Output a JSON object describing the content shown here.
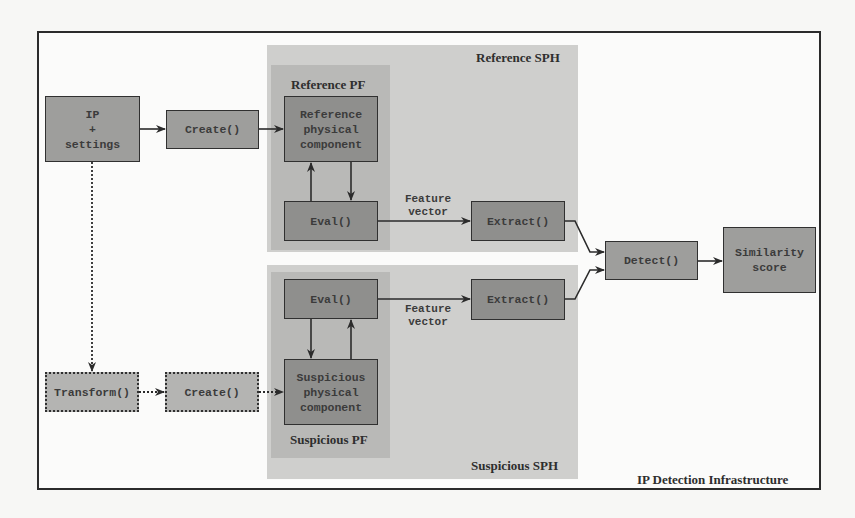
{
  "diagram": {
    "frame_label": "IP Detection Infrastructure",
    "regions": {
      "reference_sph": "Reference SPH",
      "suspicious_sph": "Suspicious SPH",
      "reference_pf": "Reference PF",
      "suspicious_pf": "Suspicious PF"
    },
    "nodes": {
      "ip_settings": "IP\n+\nsettings",
      "create_top": "Create()",
      "ref_physical": "Reference\nphysical\ncomponent",
      "eval_ref": "Eval()",
      "extract_ref": "Extract()",
      "transform": "Transform()",
      "create_bottom": "Create()",
      "susp_physical": "Suspicious\nphysical\ncomponent",
      "eval_susp": "Eval()",
      "extract_susp": "Extract()",
      "detect": "Detect()",
      "similarity": "Similarity\nscore"
    },
    "edge_labels": {
      "feature_vector_top": "Feature\nvector",
      "feature_vector_bottom": "Feature\nvector"
    },
    "edges": [
      {
        "from": "ip_settings",
        "to": "create_top",
        "style": "solid"
      },
      {
        "from": "create_top",
        "to": "ref_physical",
        "style": "solid"
      },
      {
        "from": "ref_physical",
        "to": "eval_ref",
        "style": "solid"
      },
      {
        "from": "eval_ref",
        "to": "ref_physical",
        "style": "solid"
      },
      {
        "from": "eval_ref",
        "to": "extract_ref",
        "style": "solid",
        "label": "Feature vector"
      },
      {
        "from": "extract_ref",
        "to": "detect",
        "style": "solid"
      },
      {
        "from": "ip_settings",
        "to": "transform",
        "style": "dotted"
      },
      {
        "from": "transform",
        "to": "create_bottom",
        "style": "dotted"
      },
      {
        "from": "create_bottom",
        "to": "susp_physical",
        "style": "dotted"
      },
      {
        "from": "eval_susp",
        "to": "susp_physical",
        "style": "solid"
      },
      {
        "from": "susp_physical",
        "to": "eval_susp",
        "style": "solid"
      },
      {
        "from": "eval_susp",
        "to": "extract_susp",
        "style": "solid",
        "label": "Feature vector"
      },
      {
        "from": "extract_susp",
        "to": "detect",
        "style": "solid"
      },
      {
        "from": "detect",
        "to": "similarity",
        "style": "solid"
      }
    ]
  }
}
